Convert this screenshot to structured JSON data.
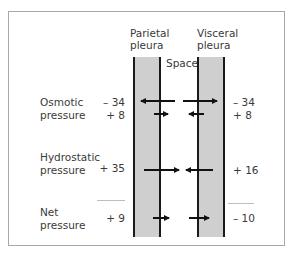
{
  "headers": {
    "parietal": [
      "Parietal",
      "pleura"
    ],
    "visceral": [
      "Visceral",
      "pleura"
    ],
    "space": "Space"
  },
  "rows": {
    "osmotic": {
      "label": [
        "Osmotic",
        "pressure"
      ],
      "parietal_values": [
        "– 34",
        "+  8"
      ],
      "visceral_values": [
        "– 34",
        "+  8"
      ]
    },
    "hydrostatic": {
      "label": [
        "Hydrostatic",
        "pressure"
      ],
      "parietal_value": "+ 35",
      "visceral_value": "+ 16"
    },
    "net": {
      "label": [
        "Net",
        "pressure"
      ],
      "parietal_value": "+  9",
      "visceral_value": "– 10"
    }
  },
  "colors": {
    "membrane_fill": "#cfcfcf",
    "membrane_edge": "#1a1a1a",
    "arrow": "#111111",
    "frame": "#a8a8a8"
  }
}
